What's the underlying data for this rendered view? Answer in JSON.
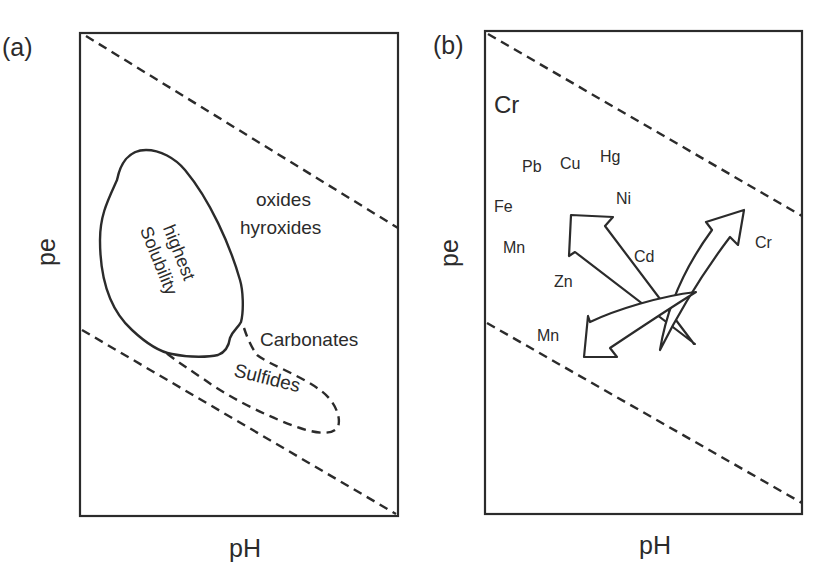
{
  "figure": {
    "panel_a": {
      "label": "(a)",
      "x_axis_label": "pH",
      "y_axis_label": "pe",
      "regions": {
        "solubility_line1": "highest",
        "solubility_line2": "Solubility",
        "oxides_line1": "oxides",
        "oxides_line2": "hyroxides",
        "carbonates": "Carbonates",
        "sulfides": "Sulfides"
      }
    },
    "panel_b": {
      "label": "(b)",
      "x_axis_label": "pH",
      "y_axis_label": "pe",
      "elements": {
        "cr_top": "Cr",
        "pb": "Pb",
        "cu": "Cu",
        "hg": "Hg",
        "fe": "Fe",
        "ni": "Ni",
        "mn_upper": "Mn",
        "cd": "Cd",
        "zn": "Zn",
        "cr_right": "Cr",
        "mn_lower": "Mn"
      }
    },
    "colors": {
      "ink": "#2b2b2b",
      "background": "#ffffff"
    }
  }
}
